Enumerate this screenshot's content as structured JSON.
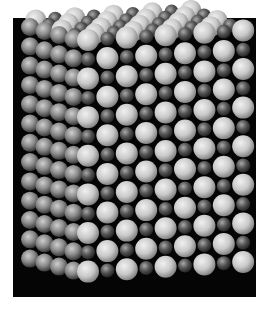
{
  "image": {
    "subject": "Crystal lattice model (rock-salt structure) photographed in grayscale",
    "alt": "Ball model of a cubic ionic crystal lattice with alternating large light spheres and small dark spheres",
    "frame": {
      "x": 13,
      "y": 18,
      "width": 243,
      "height": 279,
      "color": "#050505"
    },
    "background": "#ffffff",
    "colors": {
      "large_ion": "#c9c9c9",
      "large_ion_highlight": "#f0f0f0",
      "large_ion_shadow": "#7a7a7a",
      "small_ion": "#545454",
      "small_ion_highlight": "#a8a8a8",
      "small_ion_shadow": "#1e1e1e",
      "side_ion": "#8a8a8a",
      "side_ion_highlight": "#cfcfcf",
      "side_ion_shadow": "#2c2c2c"
    },
    "lattice": {
      "front_face": {
        "columns": 9,
        "rows": 13,
        "origin_x": 88,
        "origin_y": 40,
        "dx": 19.4,
        "dy": 19.3,
        "slant_y_per_col": -1.2,
        "large_r": 11,
        "small_r": 7
      },
      "side_face": {
        "layers": 4,
        "rows": 13,
        "dx": -14.5,
        "dy": -4,
        "r": 9
      },
      "top_face": {
        "layers": 4,
        "columns": 9
      }
    }
  }
}
